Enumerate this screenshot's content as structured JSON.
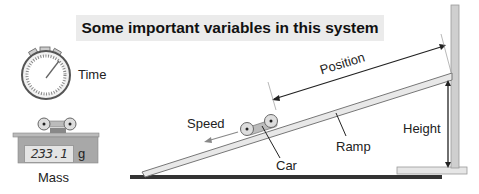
{
  "title": "Some important variables in this system",
  "labels": {
    "time": "Time",
    "mass": "Mass",
    "mass_value": "233.1",
    "mass_unit": "g",
    "position": "Position",
    "speed": "Speed",
    "car": "Car",
    "ramp": "Ramp",
    "height": "Height"
  },
  "icons": {
    "stopwatch": "stopwatch-icon",
    "scale": "digital-scale-icon",
    "car": "car-icon"
  },
  "colors": {
    "title_bg": "#ebebeb",
    "ramp_fill": "#e8e8e8",
    "post_fill": "#cfcfcf",
    "ground": "#333333",
    "scale_body": "#a8a8a8"
  }
}
